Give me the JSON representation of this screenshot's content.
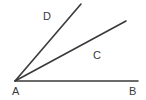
{
  "figure": {
    "kind": "geometry-angle-diagram",
    "width": 146,
    "height": 100,
    "background_color": "#ffffff",
    "stroke_color": "#3a3a3a",
    "text_color": "#3a3a3a"
  },
  "points": {
    "A": {
      "label": "A",
      "x": 15,
      "y": 81
    },
    "B": {
      "label": "B",
      "x": 138,
      "y": 81
    }
  },
  "rays": [
    {
      "name": "ray-AB",
      "label": "B",
      "from": {
        "x": 15,
        "y": 81
      },
      "to": {
        "x": 138,
        "y": 81
      }
    },
    {
      "name": "ray-AC",
      "label": "C",
      "from": {
        "x": 15,
        "y": 81
      },
      "to": {
        "x": 126,
        "y": 21
      }
    },
    {
      "name": "ray-AD",
      "label": "D",
      "from": {
        "x": 15,
        "y": 81
      },
      "to": {
        "x": 81,
        "y": 4
      }
    }
  ],
  "labels": {
    "vertex": "A",
    "endpoint": "B",
    "ray_c": "C",
    "ray_d": "D"
  }
}
